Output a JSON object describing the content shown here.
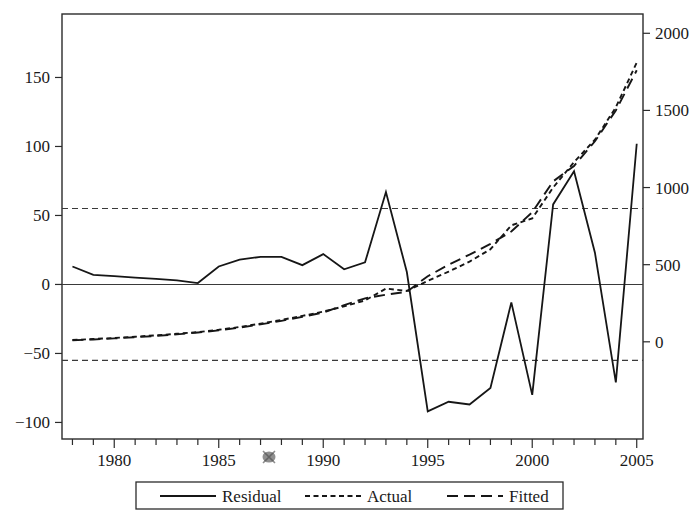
{
  "chart_data": {
    "type": "line",
    "title": "",
    "subtitle": "",
    "xlabel": "",
    "ylabel_left": "",
    "ylabel_right": "",
    "x": [
      1978,
      1979,
      1980,
      1981,
      1982,
      1983,
      1984,
      1985,
      1986,
      1987,
      1988,
      1989,
      1990,
      1991,
      1992,
      1993,
      1994,
      1995,
      1996,
      1997,
      1998,
      1999,
      2000,
      2001,
      2002,
      2003,
      2004,
      2005
    ],
    "xlim": [
      1977.5,
      2005.3
    ],
    "xticks": [
      1980,
      1985,
      1990,
      1995,
      2000,
      2005
    ],
    "xtick_labels": [
      "1980",
      "1985",
      "1990",
      "1995",
      "2000",
      "2005"
    ],
    "xtick_minor_step": 1,
    "left_axis": {
      "ticks": [
        -100,
        -50,
        0,
        50,
        100,
        150
      ],
      "tick_labels": [
        "−100",
        "−50",
        "0",
        "50",
        "100",
        "150"
      ],
      "lim": [
        -112,
        196
      ]
    },
    "right_axis": {
      "ticks": [
        0,
        500,
        1000,
        1500,
        2000
      ],
      "tick_labels": [
        "0",
        "500",
        "1000",
        "1500",
        "2000"
      ],
      "lim": [
        -630,
        2125
      ]
    },
    "gridlines": [
      {
        "value": 0,
        "axis": "left",
        "style": "solid"
      },
      {
        "value": 55,
        "axis": "left",
        "style": "dashed"
      },
      {
        "value": -55,
        "axis": "left",
        "style": "dashed"
      }
    ],
    "legend_position": "bottom",
    "series": [
      {
        "name": "Residual",
        "style": "solid",
        "axis": "left",
        "values": [
          13,
          7,
          6,
          5,
          4,
          3,
          1,
          13,
          18,
          20,
          20,
          14,
          22,
          11,
          16,
          67,
          9,
          -92,
          -85,
          -87,
          -75,
          -13,
          -80,
          58,
          82,
          23,
          -71,
          102
        ]
      },
      {
        "name": "Actual",
        "style": "dotted",
        "axis": "right",
        "values": [
          12,
          18,
          25,
          33,
          42,
          52,
          63,
          78,
          96,
          118,
          142,
          168,
          196,
          230,
          268,
          345,
          330,
          395,
          455,
          520,
          600,
          755,
          800,
          1000,
          1165,
          1310,
          1520,
          1810
        ]
      },
      {
        "name": "Fitted",
        "style": "dashed",
        "axis": "right",
        "values": [
          10,
          15,
          22,
          30,
          38,
          48,
          60,
          74,
          92,
          113,
          136,
          162,
          190,
          238,
          282,
          305,
          325,
          425,
          500,
          565,
          635,
          715,
          840,
          1040,
          1140,
          1300,
          1500,
          1760
        ]
      }
    ],
    "legend_entries": [
      {
        "label": "Residual",
        "style": "solid"
      },
      {
        "label": "Actual",
        "style": "dotted"
      },
      {
        "label": "Fitted",
        "style": "dashed"
      }
    ]
  }
}
